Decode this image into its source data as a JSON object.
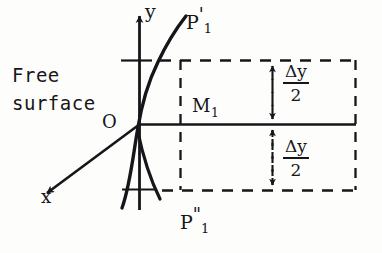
{
  "figure": {
    "labels": {
      "free_surface_line1": "Free",
      "free_surface_line2": "surface",
      "y_axis": "y",
      "x_axis": "x",
      "origin": "O",
      "midpoint": "M",
      "midpoint_sub": "1",
      "point_upper": "P",
      "point_upper_prime": "'",
      "point_upper_sub": "1",
      "point_lower": "P",
      "point_lower_prime": "\"",
      "point_lower_sub": "1"
    },
    "annotations": {
      "delta_upper_num": "Δy",
      "delta_upper_den": "2",
      "delta_lower_num": "Δy",
      "delta_lower_den": "2"
    },
    "colors": {
      "ink": "#16161a",
      "paper": "#fdfdfc"
    },
    "geometry": {
      "origin_px": [
        139,
        124
      ],
      "y_axis_top_px": 12,
      "y_axis_bottom_px": 210,
      "x_axis_arrow_tip_px": [
        40,
        198
      ],
      "horizontal_axis_right_px": 356,
      "dashed_upper_y_px": 60,
      "dashed_lower_y_px": 190,
      "dashed_vertical_left_px": 180,
      "dashed_vertical_right_px": 272,
      "dashed_right_edge_px": 356
    }
  }
}
